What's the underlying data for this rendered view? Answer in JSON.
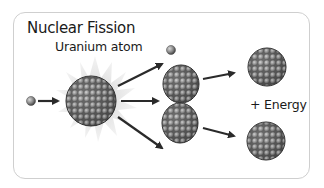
{
  "title": "Nuclear Fission",
  "labels": {
    "uranium": "Uranium atom",
    "energy": "+ Energy"
  },
  "elements": {
    "incoming_neutron": "neutron",
    "uranium_nucleus": "uranium-235 nucleus",
    "released_neutron": "neutron",
    "splitting_nucleus_top": "nucleus fragment",
    "splitting_nucleus_bottom": "nucleus fragment",
    "product_top": "fission product",
    "product_bottom": "fission product"
  },
  "colors": {
    "arrow": "#2a2a2a",
    "nucleon": "#8a8a8a",
    "nucleon_dark": "#3a3a3a",
    "burst": "#e4e4e4",
    "frame_border": "#cfcfcf"
  }
}
